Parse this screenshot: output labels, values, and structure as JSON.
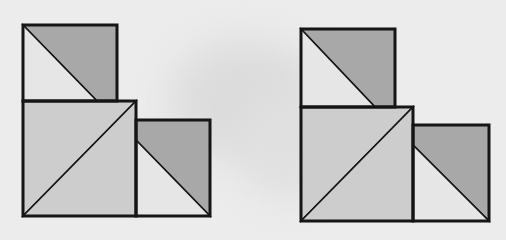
{
  "diagram": {
    "type": "tangram-like square dissection",
    "colors": {
      "background": "#ececec",
      "dark_gray": "#a8a8a8",
      "medium_gray": "#cdcdcd",
      "light_gray": "#e6e6e6",
      "outline": "#151515"
    },
    "figures": [
      {
        "name": "left-figure",
        "top_rect": {
          "x1": 23,
          "y1": 25,
          "x2": 117,
          "y2": 101,
          "diag_end_x": 97
        },
        "big_square": {
          "x1": 23,
          "y1": 101,
          "x2": 136,
          "y2": 216
        },
        "right_rect": {
          "x1": 136,
          "y1": 120,
          "x2": 210,
          "y2": 216,
          "diag_start_y": 140
        }
      },
      {
        "name": "right-figure",
        "top_rect": {
          "x1": 301,
          "y1": 29,
          "x2": 395,
          "y2": 107,
          "diag_end_x": 375
        },
        "big_square": {
          "x1": 301,
          "y1": 107,
          "x2": 413,
          "y2": 221
        },
        "right_rect": {
          "x1": 413,
          "y1": 125,
          "x2": 489,
          "y2": 221,
          "diag_start_y": 145
        }
      }
    ]
  }
}
